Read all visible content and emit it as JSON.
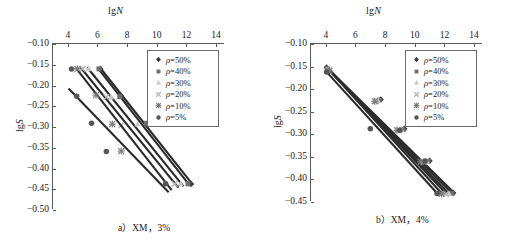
{
  "figure": {
    "panels": [
      {
        "id": "panel-a",
        "caption": "a）XM，3%",
        "xaxis": {
          "label_prefix": "lg",
          "label_var": "N",
          "ticks": [
            4,
            6,
            8,
            10,
            12,
            14
          ],
          "min": 3,
          "max": 14.6,
          "position": "top"
        },
        "yaxis": {
          "label_prefix": "lg",
          "label_var": "S",
          "ticks": [
            -0.1,
            -0.15,
            -0.2,
            -0.25,
            -0.3,
            -0.35,
            -0.4,
            -0.45,
            -0.5
          ],
          "tick_labels": [
            "-0.10",
            "-0.15",
            "-0.20",
            "-0.25",
            "-0.30",
            "-0.35",
            "-0.40",
            "-0.45",
            "-0.50"
          ],
          "min": -0.5,
          "max": -0.1
        }
      },
      {
        "id": "panel-b",
        "caption": "b）XM，4%",
        "xaxis": {
          "label_prefix": "lg",
          "label_var": "N",
          "ticks": [
            4,
            6,
            8,
            10,
            12,
            14
          ],
          "min": 3,
          "max": 14.6,
          "position": "top"
        },
        "yaxis": {
          "label_prefix": "lg",
          "label_var": "S",
          "ticks": [
            -0.1,
            -0.15,
            -0.2,
            -0.25,
            -0.3,
            -0.35,
            -0.4,
            -0.45
          ],
          "tick_labels": [
            "-0.10",
            "-0.15",
            "-0.20",
            "-0.25",
            "-0.30",
            "-0.35",
            "-0.40",
            "-0.45"
          ],
          "min": -0.45,
          "max": -0.1
        }
      }
    ],
    "legend": {
      "entries": [
        {
          "label_var": "ρ",
          "label_rest": "=50%",
          "marker": "diamond",
          "color": "#3c3c3c"
        },
        {
          "label_var": "ρ",
          "label_rest": "=40%",
          "marker": "square",
          "color": "#6e6e6e"
        },
        {
          "label_var": "ρ",
          "label_rest": "=30%",
          "marker": "triangle",
          "color": "#c8c8c8"
        },
        {
          "label_var": "ρ",
          "label_rest": "=20%",
          "marker": "cross",
          "color": "#b4b4b4"
        },
        {
          "label_var": "ρ",
          "label_rest": "=10%",
          "marker": "star",
          "color": "#7a7a7a"
        },
        {
          "label_var": "ρ",
          "label_rest": "=5%",
          "marker": "circle",
          "color": "#555555"
        }
      ]
    }
  },
  "chart_data": [
    {
      "type": "scatter",
      "title": "a）XM，3%",
      "xlabel": "lgN",
      "ylabel": "lgS",
      "xlim": [
        3,
        14.6
      ],
      "ylim": [
        -0.5,
        -0.1
      ],
      "xticks": [
        4,
        6,
        8,
        10,
        12,
        14
      ],
      "yticks": [
        -0.1,
        -0.15,
        -0.2,
        -0.25,
        -0.3,
        -0.35,
        -0.4,
        -0.45,
        -0.5
      ],
      "grid": false,
      "legend_position": "top-right",
      "series": [
        {
          "name": "ρ=50%",
          "marker": "diamond",
          "color": "#3c3c3c",
          "x": [
            6.2,
            7.6,
            9.4,
            12.3
          ],
          "y": [
            -0.16,
            -0.225,
            -0.291,
            -0.437
          ],
          "fit_line": {
            "x": [
              6.15,
              12.45
            ],
            "y": [
              -0.156,
              -0.44
            ]
          }
        },
        {
          "name": "ρ=40%",
          "marker": "square",
          "color": "#6e6e6e",
          "x": [
            6.1,
            7.5,
            9.3,
            12.1
          ],
          "y": [
            -0.16,
            -0.227,
            -0.291,
            -0.437
          ],
          "fit_line": {
            "x": [
              6.0,
              12.2
            ],
            "y": [
              -0.157,
              -0.44
            ]
          }
        },
        {
          "name": "ρ=30%",
          "marker": "triangle",
          "color": "#c8c8c8",
          "x": [
            5.4,
            6.9,
            8.7,
            11.6
          ],
          "y": [
            -0.16,
            -0.228,
            -0.293,
            -0.437
          ],
          "fit_line": {
            "x": [
              5.3,
              11.8
            ],
            "y": [
              -0.156,
              -0.443
            ]
          }
        },
        {
          "name": "ρ=20%",
          "marker": "cross",
          "color": "#b4b4b4",
          "x": [
            5.0,
            6.6,
            7.6,
            11.2
          ],
          "y": [
            -0.16,
            -0.228,
            -0.296,
            -0.437
          ],
          "fit_line": {
            "x": [
              4.85,
              11.45
            ],
            "y": [
              -0.156,
              -0.446
            ]
          }
        },
        {
          "name": "ρ=10%",
          "marker": "star",
          "color": "#7a7a7a",
          "x": [
            4.65,
            5.9,
            7.0,
            7.6
          ],
          "y": [
            -0.16,
            -0.223,
            -0.293,
            -0.358
          ],
          "fit_line": {
            "x": [
              4.55,
              11.0
            ],
            "y": [
              -0.158,
              -0.452
            ]
          }
        },
        {
          "name": "ρ=5%",
          "marker": "circle",
          "color": "#555555",
          "x": [
            4.25,
            4.6,
            5.6,
            6.6,
            10.6
          ],
          "y": [
            -0.16,
            -0.226,
            -0.291,
            -0.359,
            -0.437
          ],
          "fit_line": {
            "x": [
              4.05,
              10.8
            ],
            "y": [
              -0.207,
              -0.457
            ]
          }
        }
      ]
    },
    {
      "type": "scatter",
      "title": "b）XM，4%",
      "xlabel": "lgN",
      "ylabel": "lgS",
      "xlim": [
        3,
        14.6
      ],
      "ylim": [
        -0.45,
        -0.1
      ],
      "xticks": [
        4,
        6,
        8,
        10,
        12,
        14
      ],
      "yticks": [
        -0.1,
        -0.15,
        -0.2,
        -0.25,
        -0.3,
        -0.35,
        -0.4,
        -0.45
      ],
      "grid": false,
      "legend_position": "top-right",
      "series": [
        {
          "name": "ρ=50%",
          "marker": "diamond",
          "color": "#3c3c3c",
          "x": [
            4.05,
            7.7,
            9.3,
            11.0,
            12.6
          ],
          "y": [
            -0.152,
            -0.223,
            -0.288,
            -0.359,
            -0.43
          ],
          "fit_line": {
            "x": [
              4.0,
              12.7
            ],
            "y": [
              -0.15,
              -0.431
            ]
          }
        },
        {
          "name": "ρ=40%",
          "marker": "square",
          "color": "#6e6e6e",
          "x": [
            4.1,
            7.6,
            9.2,
            10.9,
            12.5
          ],
          "y": [
            -0.155,
            -0.224,
            -0.289,
            -0.36,
            -0.431
          ],
          "fit_line": {
            "x": [
              4.05,
              12.55
            ],
            "y": [
              -0.152,
              -0.432
            ]
          }
        },
        {
          "name": "ρ=30%",
          "marker": "triangle",
          "color": "#c8c8c8",
          "x": [
            4.15,
            7.5,
            9.1,
            10.8,
            12.3
          ],
          "y": [
            -0.157,
            -0.225,
            -0.29,
            -0.36,
            -0.431
          ],
          "fit_line": {
            "x": [
              4.1,
              12.35
            ],
            "y": [
              -0.154,
              -0.433
            ]
          }
        },
        {
          "name": "ρ=20%",
          "marker": "cross",
          "color": "#b4b4b4",
          "x": [
            4.2,
            7.4,
            8.9,
            10.6,
            12.1
          ],
          "y": [
            -0.158,
            -0.226,
            -0.29,
            -0.361,
            -0.432
          ],
          "fit_line": {
            "x": [
              4.15,
              12.15
            ],
            "y": [
              -0.155,
              -0.433
            ]
          }
        },
        {
          "name": "ρ=10%",
          "marker": "star",
          "color": "#7a7a7a",
          "x": [
            4.25,
            7.3,
            8.8,
            10.4,
            11.8
          ],
          "y": [
            -0.16,
            -0.227,
            -0.291,
            -0.361,
            -0.432
          ],
          "fit_line": {
            "x": [
              4.2,
              11.9
            ],
            "y": [
              -0.157,
              -0.434
            ]
          }
        },
        {
          "name": "ρ=5%",
          "marker": "circle",
          "color": "#555555",
          "x": [
            4.05,
            7.0,
            9.0,
            10.7,
            11.5
          ],
          "y": [
            -0.162,
            -0.288,
            -0.291,
            -0.359,
            -0.431
          ],
          "fit_line": {
            "x": [
              4.0,
              11.6
            ],
            "y": [
              -0.16,
              -0.434
            ]
          }
        }
      ]
    }
  ]
}
